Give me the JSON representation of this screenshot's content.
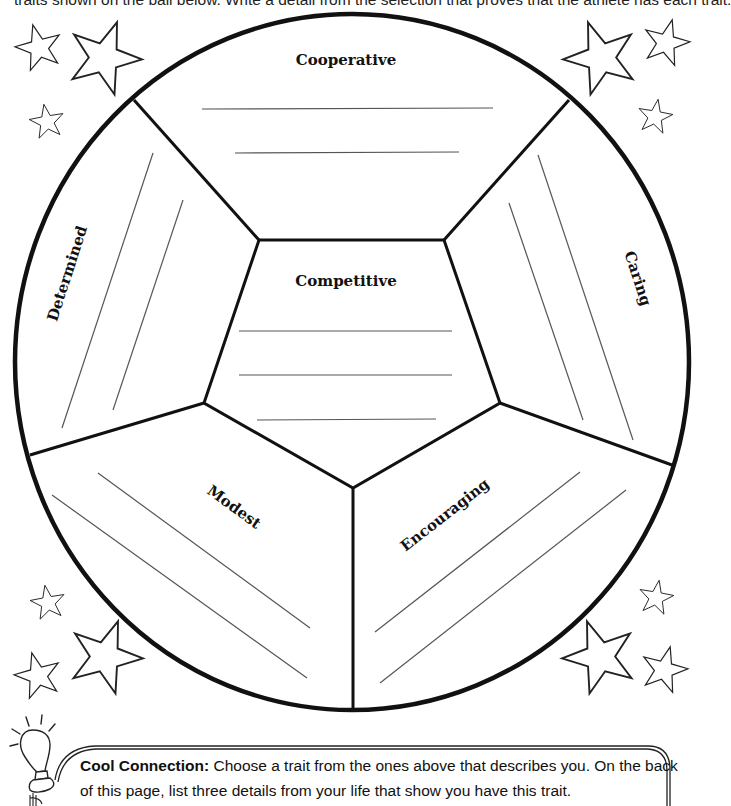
{
  "instructions": {
    "text": "traits shown on the ball below. Write a detail from the selection that proves that the athlete has each trait."
  },
  "ball": {
    "sections": [
      {
        "id": "cooperative",
        "label": "Cooperative",
        "answer_lines": 2
      },
      {
        "id": "caring",
        "label": "Caring",
        "answer_lines": 2
      },
      {
        "id": "encouraging",
        "label": "Encouraging",
        "answer_lines": 2
      },
      {
        "id": "modest",
        "label": "Modest",
        "answer_lines": 2
      },
      {
        "id": "determined",
        "label": "Determined",
        "answer_lines": 2
      },
      {
        "id": "competitive",
        "label": "Competitive",
        "answer_lines": 3
      }
    ]
  },
  "decorations": {
    "stars": [
      "star-icon"
    ],
    "lightbulb": "lightbulb-icon"
  },
  "cool_connection": {
    "title": "Cool Connection:",
    "body": " Choose a trait from the ones above that describes you. On the back of this page, list three details from your life that show you have this trait."
  },
  "colors": {
    "ink": "#111111",
    "paper": "#ffffff"
  }
}
